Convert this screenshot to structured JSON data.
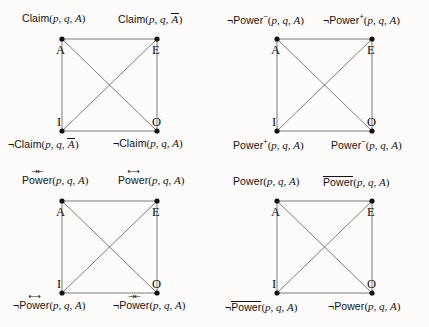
{
  "figure": {
    "vertex_letters": [
      "A",
      "E",
      "I",
      "O"
    ],
    "colors": {
      "line": "#6e6e6e",
      "node": "#111111",
      "text": "#111111",
      "background": "#fdfcfb"
    },
    "geometry": {
      "node_radius": 2.6,
      "edges": [
        "A-E",
        "A-I",
        "E-O",
        "I-O",
        "A-O",
        "E-I"
      ]
    }
  },
  "squares": [
    {
      "id": "square-claim",
      "position": "top-left",
      "labels": {
        "A": {
          "text": "Claim(p, q, A)",
          "predicate": "Claim",
          "args": "p, q, A",
          "negated": false,
          "overline_arg": false
        },
        "E": {
          "text": "Claim(p, q, A̅)",
          "predicate": "Claim",
          "args": "p, q, A",
          "negated": false,
          "overline_arg": true
        },
        "I": {
          "text": "¬Claim(p, q, A̅)",
          "predicate": "Claim",
          "args": "p, q, A",
          "negated": true,
          "overline_arg": true
        },
        "O": {
          "text": "¬Claim(p, q, A)",
          "predicate": "Claim",
          "args": "p, q, A",
          "negated": true,
          "overline_arg": false
        }
      }
    },
    {
      "id": "square-power-pm",
      "position": "top-right",
      "labels": {
        "A": {
          "text": "¬Power⁻(p, q, A)",
          "predicate": "Power",
          "superscript": "−",
          "args": "p, q, A",
          "negated": true
        },
        "E": {
          "text": "¬Power⁺(p, q, A)",
          "predicate": "Power",
          "superscript": "+",
          "args": "p, q, A",
          "negated": true
        },
        "I": {
          "text": "Power⁺(p, q, A)",
          "predicate": "Power",
          "superscript": "+",
          "args": "p, q, A",
          "negated": false
        },
        "O": {
          "text": "Power⁻(p, q, A)",
          "predicate": "Power",
          "superscript": "−",
          "args": "p, q, A",
          "negated": false
        }
      }
    },
    {
      "id": "square-power-arrows",
      "position": "bottom-left",
      "labels": {
        "A": {
          "text": "Power⃗⃖(p, q, A)",
          "predicate": "Power",
          "accent": "→←",
          "args": "p, q, A",
          "negated": false
        },
        "E": {
          "text": "Power⃖⃗(p, q, A)",
          "predicate": "Power",
          "accent": "←→",
          "args": "p, q, A",
          "negated": false
        },
        "I": {
          "text": "¬Power⃖⃗(p, q, A)",
          "predicate": "Power",
          "accent": "←→",
          "args": "p, q, A",
          "negated": true
        },
        "O": {
          "text": "¬Power⃗⃖(p, q, A)",
          "predicate": "Power",
          "accent": "→←",
          "args": "p, q, A",
          "negated": true
        }
      }
    },
    {
      "id": "square-power-overline",
      "position": "bottom-right",
      "labels": {
        "A": {
          "text": "Power(p, q, A)",
          "predicate": "Power",
          "args": "p, q, A",
          "negated": false,
          "overline_predicate": false
        },
        "E": {
          "text": "P̅o̅w̅e̅r̅(p, q, A)",
          "predicate": "Power",
          "args": "p, q, A",
          "negated": false,
          "overline_predicate": true
        },
        "I": {
          "text": "¬P̅o̅w̅e̅r̅(p, q, A)",
          "predicate": "Power",
          "args": "p, q, A",
          "negated": true,
          "overline_predicate": true
        },
        "O": {
          "text": "¬Power(p, q, A)",
          "predicate": "Power",
          "args": "p, q, A",
          "negated": true,
          "overline_predicate": false
        }
      }
    }
  ],
  "glyphs": {
    "negation": "¬",
    "arrow_in": "→←",
    "arrow_out": "←→",
    "minus_sup": "−",
    "plus_sup": "+"
  }
}
